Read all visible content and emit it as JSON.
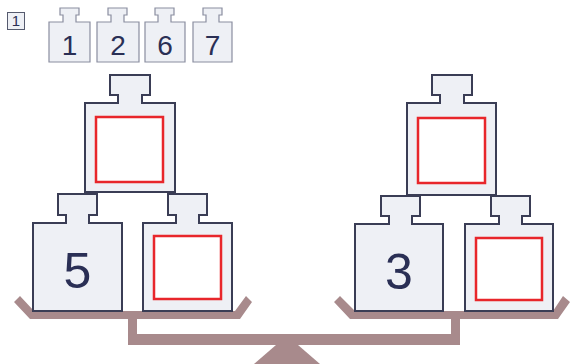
{
  "problem": {
    "number": "1"
  },
  "weight_options": [
    {
      "label": "1"
    },
    {
      "label": "2"
    },
    {
      "label": "6"
    },
    {
      "label": "7"
    }
  ],
  "scale": {
    "left_pan": {
      "top_weight": {
        "value": "",
        "type": "blank"
      },
      "bottom_left_weight": {
        "value": "5",
        "type": "given"
      },
      "bottom_right_weight": {
        "value": "",
        "type": "blank"
      }
    },
    "right_pan": {
      "top_weight": {
        "value": "",
        "type": "blank"
      },
      "bottom_left_weight": {
        "value": "3",
        "type": "given"
      },
      "bottom_right_weight": {
        "value": "",
        "type": "blank"
      }
    }
  },
  "colors": {
    "weight_fill": "#eef0f5",
    "weight_stroke": "#3a3d55",
    "digit": "#2a2f55",
    "answer_box": "#e8262b",
    "scale": "#a88a8c"
  }
}
